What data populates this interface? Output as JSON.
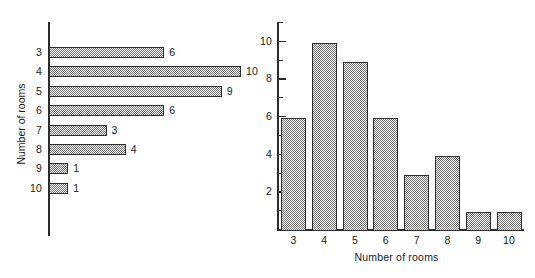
{
  "chart_data": [
    {
      "type": "bar",
      "orientation": "horizontal",
      "title": "",
      "xlabel": "",
      "ylabel": "Number of rooms",
      "categories": [
        "3",
        "4",
        "5",
        "6",
        "7",
        "8",
        "9",
        "10"
      ],
      "values": [
        6,
        10,
        9,
        6,
        3,
        4,
        1,
        1
      ],
      "data_labels": [
        "6",
        "10",
        "9",
        "6",
        "3",
        "4",
        "1",
        "1"
      ],
      "xlim": [
        0,
        10
      ],
      "ylim": null,
      "grid": false,
      "legend": null,
      "bar_fill": "#9a9a9a",
      "bar_edge": "#2f2f2f",
      "axis_color": "#2b2b2b"
    },
    {
      "type": "bar",
      "orientation": "vertical",
      "title": "",
      "xlabel": "Number of rooms",
      "ylabel": "",
      "categories": [
        "3",
        "4",
        "5",
        "6",
        "7",
        "8",
        "9",
        "10"
      ],
      "values": [
        6,
        10,
        9,
        6,
        3,
        4,
        1,
        1
      ],
      "ytick_labels": [
        "2",
        "4",
        "6",
        "8",
        "10"
      ],
      "ytick_values": [
        2,
        4,
        6,
        8,
        10
      ],
      "yminor_values": [
        1,
        3,
        5,
        7,
        9,
        11
      ],
      "ylim": [
        0,
        11
      ],
      "grid": false,
      "legend": null,
      "bar_fill": "#9a9a9a",
      "bar_edge": "#2f2f2f",
      "axis_color": "#2b2b2b"
    }
  ]
}
